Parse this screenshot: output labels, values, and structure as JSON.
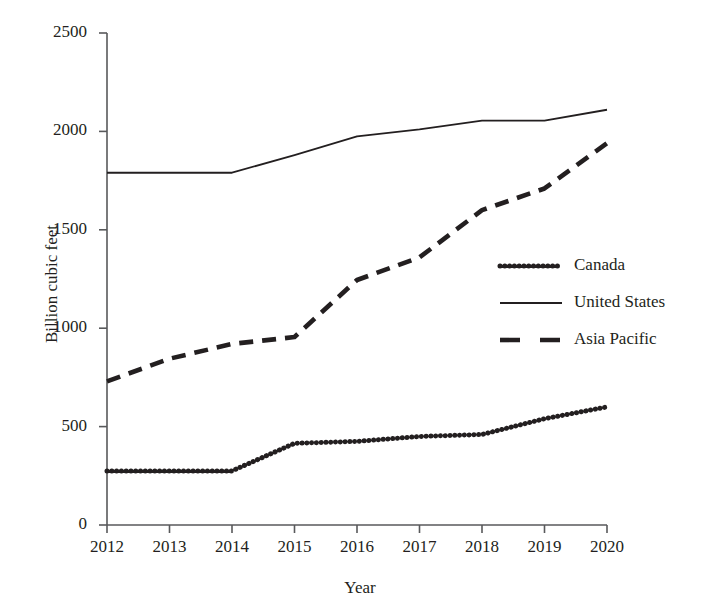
{
  "chart_data": {
    "type": "line",
    "title": "",
    "xlabel": "Year",
    "ylabel": "Billion cubic feet",
    "x": [
      2012,
      2013,
      2014,
      2015,
      2016,
      2017,
      2018,
      2019,
      2020
    ],
    "categories": [
      "2012",
      "2013",
      "2014",
      "2015",
      "2016",
      "2017",
      "2018",
      "2019",
      "2020"
    ],
    "xlim": [
      2012,
      2020
    ],
    "ylim": [
      0,
      2500
    ],
    "yticks": [
      0,
      500,
      1000,
      1500,
      2000,
      2500
    ],
    "ytick_labels": [
      "0",
      "500",
      "1000",
      "1500",
      "2000",
      "2500"
    ],
    "grid": false,
    "legend_position": "center right",
    "series": [
      {
        "name": "Canada",
        "style": "dotted",
        "color": "#231f20",
        "values": [
          275,
          275,
          275,
          415,
          425,
          450,
          460,
          540,
          600
        ]
      },
      {
        "name": "United States",
        "style": "solid",
        "color": "#231f20",
        "values": [
          1790,
          1790,
          1790,
          1880,
          1975,
          2010,
          2055,
          2055,
          2110
        ]
      },
      {
        "name": "Asia Pacific",
        "style": "dashed",
        "color": "#231f20",
        "values": [
          730,
          845,
          920,
          955,
          1245,
          1360,
          1600,
          1710,
          1940
        ]
      }
    ]
  },
  "legend": {
    "items": [
      {
        "label": "Canada",
        "style": "dotted"
      },
      {
        "label": "United States",
        "style": "solid"
      },
      {
        "label": "Asia Pacific",
        "style": "dashed"
      }
    ]
  },
  "axis": {
    "y_title": "Billion cubic feet",
    "x_title": "Year"
  }
}
